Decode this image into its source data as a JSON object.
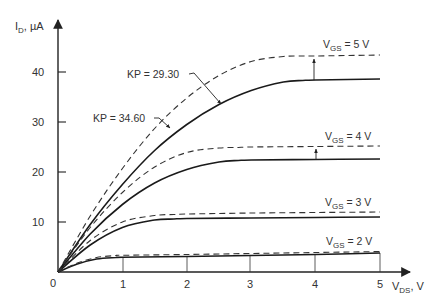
{
  "chart_data": {
    "type": "line",
    "title": "",
    "xlabel": "V_DS, V",
    "ylabel": "I_D, µA",
    "xlim": [
      0,
      5
    ],
    "ylim": [
      0,
      45
    ],
    "grid": false,
    "x_ticks": [
      0,
      1,
      2,
      3,
      4,
      5
    ],
    "y_ticks": [
      10,
      20,
      30,
      40
    ],
    "origin_label": "0",
    "series": [
      {
        "name": "VGS = 5 V, KP = 29.30 (solid)",
        "style": "solid",
        "vgs": 5,
        "x": [
          0,
          0.5,
          1,
          1.5,
          2,
          2.5,
          3,
          3.5,
          3.8,
          4,
          5
        ],
        "y": [
          0,
          9.5,
          17.5,
          24.3,
          29.5,
          33.5,
          36.3,
          38.0,
          38.3,
          38.4,
          38.6
        ]
      },
      {
        "name": "VGS = 5 V, KP = 34.60 (dashed)",
        "style": "dashed",
        "vgs": 5,
        "x": [
          0,
          0.5,
          1,
          1.5,
          2,
          2.5,
          3,
          3.5,
          3.8,
          4,
          5
        ],
        "y": [
          0,
          11.2,
          20.7,
          28.7,
          34.8,
          39.3,
          42.1,
          43.1,
          43.2,
          43.2,
          43.4
        ]
      },
      {
        "name": "VGS = 4 V, KP = 29.30 (solid)",
        "style": "solid",
        "vgs": 4,
        "x": [
          0,
          0.5,
          1,
          1.5,
          2,
          2.5,
          2.8,
          3,
          4,
          5
        ],
        "y": [
          0,
          7.6,
          13.5,
          17.8,
          20.5,
          22.0,
          22.3,
          22.4,
          22.5,
          22.6
        ]
      },
      {
        "name": "VGS = 4 V, KP = 34.60 (dashed)",
        "style": "dashed",
        "vgs": 4,
        "x": [
          0,
          0.5,
          1,
          1.5,
          2,
          2.5,
          2.8,
          3,
          4,
          5
        ],
        "y": [
          0,
          8.9,
          15.9,
          21.0,
          23.9,
          24.8,
          24.9,
          25.0,
          25.1,
          25.2
        ]
      },
      {
        "name": "VGS = 3 V, KP = 29.30 (solid)",
        "style": "solid",
        "vgs": 3,
        "x": [
          0,
          0.5,
          1,
          1.5,
          1.8,
          2,
          3,
          4,
          5
        ],
        "y": [
          0,
          5.4,
          8.9,
          10.4,
          10.6,
          10.7,
          10.8,
          10.9,
          11.0
        ]
      },
      {
        "name": "VGS = 3 V, KP = 34.60 (dashed)",
        "style": "dashed",
        "vgs": 3,
        "x": [
          0,
          0.5,
          1,
          1.5,
          1.8,
          2,
          3,
          4,
          5
        ],
        "y": [
          0,
          6.3,
          10.0,
          11.3,
          11.5,
          11.6,
          11.8,
          11.9,
          12.0
        ]
      },
      {
        "name": "VGS = 2 V, KP = 29.30 (solid)",
        "style": "solid",
        "vgs": 2,
        "x": [
          0,
          0.3,
          0.6,
          0.9,
          1,
          2,
          3,
          4,
          5
        ],
        "y": [
          0,
          1.6,
          2.6,
          2.9,
          2.95,
          3.1,
          3.3,
          3.5,
          3.8
        ]
      },
      {
        "name": "VGS = 2 V, KP = 34.60 (dashed)",
        "style": "dashed",
        "vgs": 2,
        "x": [
          0,
          0.3,
          0.6,
          0.9,
          1,
          2,
          3,
          4,
          5
        ],
        "y": [
          0,
          1.8,
          2.9,
          3.3,
          3.35,
          3.5,
          3.7,
          3.9,
          4.1
        ]
      }
    ],
    "annotations": [
      {
        "text": "KP = 29.30",
        "target": "solid VGS=5 curve",
        "arrow": true
      },
      {
        "text": "KP = 34.60",
        "target": "dashed VGS=5 curve",
        "arrow": true
      },
      {
        "text": "VGS = 5 V",
        "near_y": 43
      },
      {
        "text": "VGS = 4 V",
        "near_y": 25
      },
      {
        "text": "VGS = 3 V",
        "near_y": 12
      },
      {
        "text": "VGS = 2 V",
        "near_y": 4
      }
    ],
    "legend": null
  },
  "labels": {
    "y_axis_main": "I",
    "y_axis_sub": "D",
    "y_axis_unit": ", µA",
    "x_axis_main": "V",
    "x_axis_sub": "DS",
    "x_axis_unit": ", V",
    "origin": "0",
    "kp1": "KP = 29.30",
    "kp2": "KP = 34.60",
    "vgs_prefix": "V",
    "vgs_sub": "GS",
    "vgs5_value": " = 5 V",
    "vgs4_value": " = 4 V",
    "vgs3_value": " = 3 V",
    "vgs2_value": " = 2 V",
    "xt1": "1",
    "xt2": "2",
    "xt3": "3",
    "xt4": "4",
    "xt5": "5",
    "yt10": "10",
    "yt20": "20",
    "yt30": "30",
    "yt40": "40"
  }
}
